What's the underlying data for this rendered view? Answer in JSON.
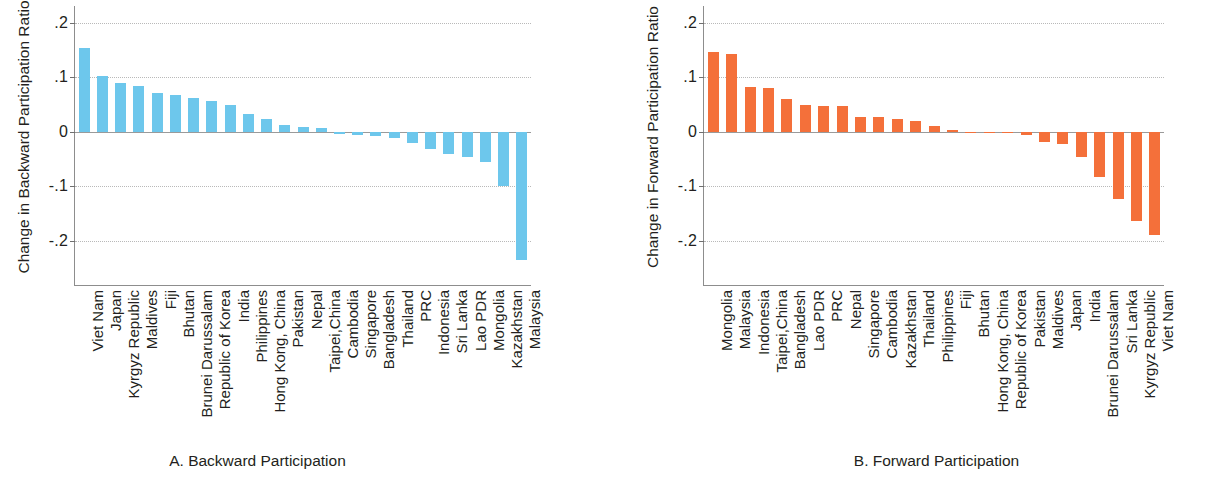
{
  "figure": {
    "background": "#ffffff",
    "panels": [
      {
        "id": "A",
        "caption": "A.  Backward Participation",
        "ylabel": "Change in Backward Participation Ratio",
        "bar_color": "#6DC7EC"
      },
      {
        "id": "B",
        "caption": "B.  Forward Participation",
        "ylabel": "Change in Forward Participation Ratio",
        "bar_color": "#F4703A"
      }
    ]
  },
  "chart_data": [
    {
      "type": "bar",
      "title": "A.  Backward Participation",
      "xlabel": "",
      "ylabel": "Change in Backward Participation Ratio",
      "ylim": [
        -0.25,
        0.22
      ],
      "yticks": [
        0.2,
        0.1,
        0,
        -0.1,
        -0.2
      ],
      "ytick_labels": [
        ".2",
        ".1",
        "0",
        "-.1",
        "-.2"
      ],
      "grid": true,
      "legend": "none",
      "color": "#6DC7EC",
      "categories": [
        "Viet Nam",
        "Japan",
        "Kyrgyz Republic",
        "Maldives",
        "Fiji",
        "Bhutan",
        "Brunei Darussalam",
        "Republic of Korea",
        "India",
        "Philippines",
        "Hong Kong, China",
        "Pakistan",
        "Nepal",
        "Taipei,China",
        "Cambodia",
        "Singapore",
        "Bangladesh",
        "Thailand",
        "PRC",
        "Indonesia",
        "Sri Lanka",
        "Lao PDR",
        "Mongolia",
        "Kazakhstan",
        "Malaysia"
      ],
      "values": [
        0.153,
        0.103,
        0.089,
        0.085,
        0.071,
        0.067,
        0.063,
        0.057,
        0.05,
        0.032,
        0.024,
        0.013,
        0.008,
        0.007,
        -0.004,
        -0.006,
        -0.007,
        -0.011,
        -0.02,
        -0.032,
        -0.041,
        -0.046,
        -0.055,
        -0.099,
        -0.235
      ]
    },
    {
      "type": "bar",
      "title": "B.  Forward Participation",
      "xlabel": "",
      "ylabel": "Change in Forward Participation Ratio",
      "ylim": [
        -0.25,
        0.22
      ],
      "yticks": [
        0.2,
        0.1,
        0,
        -0.1,
        -0.2
      ],
      "ytick_labels": [
        ".2",
        ".1",
        "0",
        "-.1",
        "-.2"
      ],
      "grid": true,
      "legend": "none",
      "color": "#F4703A",
      "categories": [
        "Mongolia",
        "Malaysia",
        "Indonesia",
        "Taipei,China",
        "Bangladesh",
        "Lao PDR",
        "PRC",
        "Nepal",
        "Singapore",
        "Cambodia",
        "Kazakhstan",
        "Thailand",
        "Philippines",
        "Fiji",
        "Bhutan",
        "Hong Kong, China",
        "Republic of Korea",
        "Pakistan",
        "Maldives",
        "Japan",
        "India",
        "Brunei Darussalam",
        "Sri Lanka",
        "Kyrgyz Republic",
        "Viet Nam"
      ],
      "values": [
        0.146,
        0.142,
        0.082,
        0.08,
        0.06,
        0.049,
        0.048,
        0.048,
        0.027,
        0.027,
        0.024,
        0.019,
        0.011,
        0.003,
        -0.002,
        -0.003,
        -0.003,
        -0.005,
        -0.018,
        -0.022,
        -0.047,
        -0.083,
        -0.123,
        -0.163,
        -0.19
      ]
    }
  ]
}
